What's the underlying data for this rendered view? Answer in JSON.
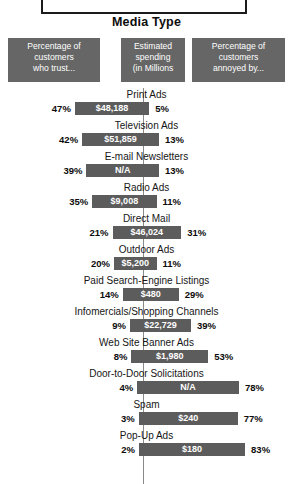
{
  "title_box": {
    "text": ""
  },
  "chart_title": "Media Type",
  "legend": [
    {
      "lines": [
        "Percentage of",
        "customers",
        "who trust..."
      ]
    },
    {
      "lines": [
        "Estimated",
        "spending",
        "(in Millions"
      ]
    },
    {
      "lines": [
        "Percentage of",
        "customers",
        "annoyed by..."
      ]
    }
  ],
  "colors": {
    "bar": "#5c5c5c",
    "legend_box": "#666666",
    "axis": "#8a8a8a",
    "text": "#111111",
    "background": "#ffffff"
  },
  "chart_data": {
    "type": "bar",
    "title": "Media Type",
    "xlabel": "",
    "ylabel": "Media Type",
    "orientation": "horizontal-diverging",
    "categories": [
      "Print Ads",
      "Television Ads",
      "E-mail Newsletters",
      "Radio Ads",
      "Direct Mail",
      "Outdoor Ads",
      "Paid Search-Engine Listings",
      "Infomercials/Shopping Channels",
      "Web Site Banner Ads",
      "Door-to-Door Solicitations",
      "Spam",
      "Pop-Up Ads"
    ],
    "series": [
      {
        "name": "Percentage of customers who trust...",
        "unit": "%",
        "values": [
          47,
          42,
          39,
          35,
          21,
          20,
          14,
          9,
          8,
          4,
          3,
          2
        ]
      },
      {
        "name": "Percentage of customers annoyed by...",
        "unit": "%",
        "values": [
          5,
          13,
          13,
          11,
          31,
          11,
          29,
          39,
          53,
          78,
          77,
          83
        ]
      },
      {
        "name": "Estimated spending (in Millions",
        "unit": "$M",
        "labels": [
          "$48,188",
          "$51,859",
          "N/A",
          "$9,008",
          "$46,024",
          "$5,200",
          "$480",
          "$22,729",
          "$1,980",
          "N/A",
          "$240",
          "$180"
        ],
        "values": [
          48188,
          51859,
          null,
          9008,
          46024,
          5200,
          480,
          22729,
          1980,
          null,
          240,
          180
        ]
      }
    ],
    "rows": [
      {
        "label": "Print Ads",
        "trust": 47,
        "trust_text": "47%",
        "annoyed": 5,
        "annoyed_text": "5%",
        "spend_text": "$48,188"
      },
      {
        "label": "Television Ads",
        "trust": 42,
        "trust_text": "42%",
        "annoyed": 13,
        "annoyed_text": "13%",
        "spend_text": "$51,859"
      },
      {
        "label": "E-mail Newsletters",
        "trust": 39,
        "trust_text": "39%",
        "annoyed": 13,
        "annoyed_text": "13%",
        "spend_text": "N/A"
      },
      {
        "label": "Radio Ads",
        "trust": 35,
        "trust_text": "35%",
        "annoyed": 11,
        "annoyed_text": "11%",
        "spend_text": "$9,008"
      },
      {
        "label": "Direct Mail",
        "trust": 21,
        "trust_text": "21%",
        "annoyed": 31,
        "annoyed_text": "31%",
        "spend_text": "$46,024"
      },
      {
        "label": "Outdoor Ads",
        "trust": 20,
        "trust_text": "20%",
        "annoyed": 11,
        "annoyed_text": "11%",
        "spend_text": "$5,200"
      },
      {
        "label": "Paid Search-Engine Listings",
        "trust": 14,
        "trust_text": "14%",
        "annoyed": 29,
        "annoyed_text": "29%",
        "spend_text": "$480"
      },
      {
        "label": "Infomercials/Shopping Channels",
        "trust": 9,
        "trust_text": "9%",
        "annoyed": 39,
        "annoyed_text": "39%",
        "spend_text": "$22,729"
      },
      {
        "label": "Web Site Banner Ads",
        "trust": 8,
        "trust_text": "8%",
        "annoyed": 53,
        "annoyed_text": "53%",
        "spend_text": "$1,980"
      },
      {
        "label": "Door-to-Door Solicitations",
        "trust": 4,
        "trust_text": "4%",
        "annoyed": 78,
        "annoyed_text": "78%",
        "spend_text": "N/A"
      },
      {
        "label": "Spam",
        "trust": 3,
        "trust_text": "3%",
        "annoyed": 77,
        "annoyed_text": "77%",
        "spend_text": "$240"
      },
      {
        "label": "Pop-Up Ads",
        "trust": 2,
        "trust_text": "2%",
        "annoyed": 83,
        "annoyed_text": "83%",
        "spend_text": "$180"
      }
    ],
    "layout": {
      "axis_x": 143,
      "row_height": 31,
      "first_row_top": 0,
      "px_per_percent_left": 1.45,
      "px_per_percent_right": 1.23,
      "grid": false,
      "legend_position": "top"
    }
  }
}
